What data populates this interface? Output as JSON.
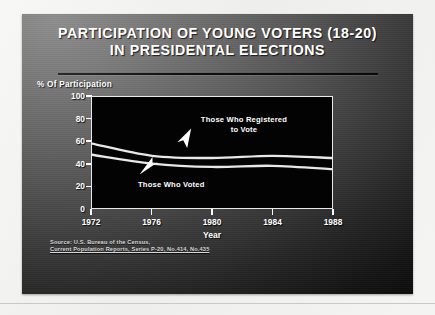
{
  "slide": {
    "title_line_1": "PARTICIPATION OF YOUNG VOTERS (18-20)",
    "title_line_2": "IN PRESIDENTAL ELECTIONS",
    "background_color": "#5e5e5e",
    "title_color": "#ffffff"
  },
  "source": {
    "line_1": "Source: U.S. Bureau of the Census,",
    "line_2": "Current Population Reports, Series P-20, No.414, No.435"
  },
  "chart_data": {
    "type": "line",
    "title": "PARTICIPATION OF YOUNG VOTERS (18-20) IN PRESIDENTAL ELECTIONS",
    "xlabel": "Year",
    "ylabel": "% Of Participation",
    "x": [
      1972,
      1976,
      1980,
      1984,
      1988
    ],
    "categories": [
      "1972",
      "1976",
      "1980",
      "1984",
      "1988"
    ],
    "xlim": [
      1972,
      1988
    ],
    "ylim": [
      0,
      100
    ],
    "yticks": [
      0,
      20,
      40,
      60,
      80,
      100
    ],
    "ytick_labels": [
      "0",
      "20",
      "40",
      "60",
      "80",
      "100"
    ],
    "xticks": [
      1972,
      1976,
      1980,
      1984,
      1988
    ],
    "xtick_labels": [
      "1972",
      "1976",
      "1980",
      "1984",
      "1988"
    ],
    "grid": false,
    "legend": "annotations",
    "plot_background": "#030303",
    "line_color": "#e8e8e8",
    "series": [
      {
        "name": "Those Who Registered to Vote",
        "values": [
          58,
          47,
          45,
          47,
          45
        ],
        "annotation": "Those Who Registered\nto Vote"
      },
      {
        "name": "Those Who Voted",
        "values": [
          48,
          40,
          37,
          38,
          35
        ],
        "annotation": "Those Who Voted"
      }
    ],
    "annotations": [
      {
        "id": "registered",
        "line_1": "Those Who Registered",
        "line_2": "to Vote"
      },
      {
        "id": "voted",
        "line_1": "Those Who Voted"
      }
    ]
  }
}
